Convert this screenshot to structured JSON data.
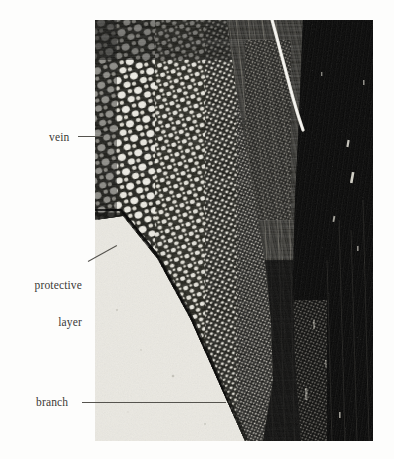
{
  "figure": {
    "kind": "photomicrograph",
    "background_color": "#fdfdfc",
    "label_color": "#3b3a36",
    "leader_color": "#55534e"
  },
  "photo": {
    "x": 95,
    "y": 20,
    "width": 278,
    "height": 421,
    "dark_tissue_color": "#0b0b0b",
    "cell_wall_color": "#1a1a18",
    "cell_lumen_color": "#f2f0ea",
    "pale_background_color": "#e9e7e0",
    "mid_tone_color": "#6b6860",
    "highlight_streak_color": "#f6f4ee"
  },
  "annotations": [
    {
      "id": "vein",
      "label": "vein",
      "label_x": 49,
      "label_y": 131,
      "align": "left",
      "leader": {
        "x1": 78,
        "y1": 136,
        "x2": 104,
        "y2": 136
      }
    },
    {
      "id": "protective-layer",
      "label_line1": "protective",
      "label_line2": "layer",
      "label_x": 20,
      "label_y": 255,
      "align": "right",
      "leader": {
        "x1": 88,
        "y1": 261,
        "x2": 117,
        "y2": 245
      }
    },
    {
      "id": "branch",
      "label": "branch",
      "label_x": 36,
      "label_y": 396,
      "align": "left",
      "leader": {
        "x1": 82,
        "y1": 402,
        "x2": 226,
        "y2": 402
      }
    }
  ]
}
